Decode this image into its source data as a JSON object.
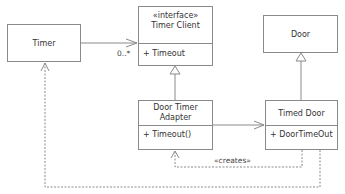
{
  "classes": {
    "timer": {
      "name": "Timer"
    },
    "timer_client": {
      "stereotype": "«interface»",
      "name": "Timer Client",
      "operation": "+ Timeout"
    },
    "door": {
      "name": "Door"
    },
    "door_timer_adapter": {
      "name_line1": "Door Timer",
      "name_line2": "Adapter",
      "operation": "+ Timeout()"
    },
    "timed_door": {
      "name": "Timed Door",
      "operation": "+ DoorTimeOut"
    }
  },
  "relations": {
    "timer_to_client_multiplicity": "0..*",
    "creates_label": "«creates»"
  }
}
